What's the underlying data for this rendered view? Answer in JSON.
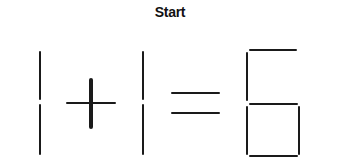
{
  "title": "Start",
  "puzzle": {
    "equation": "1 + 1 = 6",
    "stick_color": "#1a1a1a",
    "highlighted_stick": "plus-vertical",
    "glyphs": [
      {
        "symbol": "1",
        "sticks": 2
      },
      {
        "symbol": "+",
        "sticks": 2
      },
      {
        "symbol": "1",
        "sticks": 2
      },
      {
        "symbol": "=",
        "sticks": 2
      },
      {
        "symbol": "6",
        "sticks": 6
      }
    ]
  }
}
